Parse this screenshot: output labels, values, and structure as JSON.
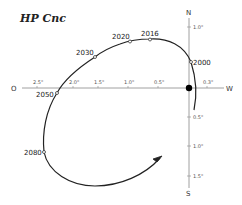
{
  "title": "HP Cnc",
  "axes": {
    "east_label": "O",
    "west_label": "W",
    "north_label": "N",
    "south_label": "S"
  },
  "horizontal_ticks": [
    "2.5\"",
    "2.0\"",
    "1.5\"",
    "1.0\"",
    "0.5\"",
    "0.3\""
  ],
  "vertical_ticks": [
    "1.0\"",
    "0.5\"",
    "1.0\"",
    "1.5\""
  ],
  "years": {
    "y2000": "2000",
    "y2016": "2016",
    "y2020": "2020",
    "y2030": "2030",
    "y2050": "2050",
    "y2080": "2080"
  },
  "colors": {
    "curve": "#222222",
    "axis": "#888888",
    "marker": "#000000"
  }
}
